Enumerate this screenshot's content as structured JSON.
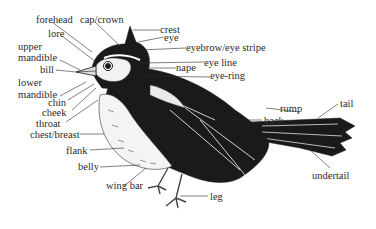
{
  "diagram": {
    "colors": {
      "ink": "#1a1a1a",
      "label": "#2b2b2b",
      "background": "#ffffff"
    },
    "labels": [
      {
        "id": "forehead",
        "text": "forehead"
      },
      {
        "id": "cap-crown",
        "text": "cap/crown"
      },
      {
        "id": "crest",
        "text": "crest"
      },
      {
        "id": "eye",
        "text": "eye"
      },
      {
        "id": "lore",
        "text": "lore"
      },
      {
        "id": "eyebrow",
        "text": "eyebrow/eye stripe"
      },
      {
        "id": "upper",
        "text": "upper"
      },
      {
        "id": "mandible-upper",
        "text": "mandible"
      },
      {
        "id": "bill",
        "text": "bill"
      },
      {
        "id": "nape",
        "text": "nape"
      },
      {
        "id": "eye-line",
        "text": "eye line"
      },
      {
        "id": "eye-ring",
        "text": "eye-ring"
      },
      {
        "id": "lower",
        "text": "lower"
      },
      {
        "id": "mandible-lower",
        "text": "mandible"
      },
      {
        "id": "chin",
        "text": "chin"
      },
      {
        "id": "cheek",
        "text": "cheek"
      },
      {
        "id": "throat",
        "text": "throat"
      },
      {
        "id": "back",
        "text": "back"
      },
      {
        "id": "rump",
        "text": "rump"
      },
      {
        "id": "tail",
        "text": "tail"
      },
      {
        "id": "chest",
        "text": "chest/breast"
      },
      {
        "id": "flank",
        "text": "flank"
      },
      {
        "id": "belly",
        "text": "belly"
      },
      {
        "id": "undertail",
        "text": "undertail"
      },
      {
        "id": "wing-bar",
        "text": "wing bar"
      },
      {
        "id": "leg",
        "text": "leg"
      }
    ]
  }
}
